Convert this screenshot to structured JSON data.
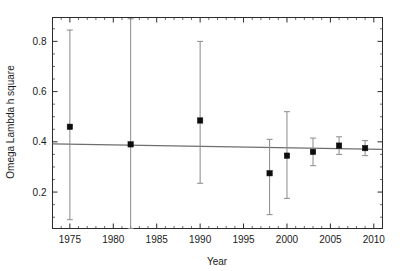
{
  "chart_data": {
    "type": "scatter",
    "title": "",
    "xlabel": "Year",
    "ylabel": "Omega Lambda h square",
    "xlim": [
      1973,
      2011
    ],
    "ylim": [
      0.055,
      0.895
    ],
    "grid": false,
    "legend": null,
    "x_ticks": [
      1975,
      1980,
      1985,
      1990,
      1995,
      2000,
      2005,
      2010
    ],
    "x_tick_labels": [
      "1975",
      "1980",
      "1985",
      "1990",
      "1995",
      "2000",
      "2005",
      "2010"
    ],
    "y_ticks": [
      0.2,
      0.4,
      0.6,
      0.8
    ],
    "y_tick_labels": [
      "0.2",
      "0.4",
      "0.6",
      "0.8"
    ],
    "x": [
      1975,
      1982,
      1990,
      1998,
      2000,
      2003,
      2006,
      2009
    ],
    "y": [
      0.46,
      0.39,
      0.485,
      0.275,
      0.345,
      0.36,
      0.385,
      0.375
    ],
    "yerr_upper": [
      0.385,
      0.5,
      0.315,
      0.135,
      0.175,
      0.055,
      0.035,
      0.03
    ],
    "yerr_lower": [
      0.37,
      0.5,
      0.25,
      0.165,
      0.17,
      0.055,
      0.035,
      0.03
    ],
    "series": [
      {
        "name": "Omega Lambda h square measurements",
        "marker": "square",
        "marker_color": "#0d0d0d",
        "errorbar_color": "#8a8a8a",
        "points": [
          {
            "x": 1975,
            "y": 0.46,
            "err_up": 0.385,
            "err_dn": 0.37
          },
          {
            "x": 1982,
            "y": 0.39,
            "err_up": 0.5,
            "err_dn": 0.5
          },
          {
            "x": 1990,
            "y": 0.485,
            "err_up": 0.315,
            "err_dn": 0.25
          },
          {
            "x": 1998,
            "y": 0.275,
            "err_up": 0.135,
            "err_dn": 0.165
          },
          {
            "x": 2000,
            "y": 0.345,
            "err_up": 0.175,
            "err_dn": 0.17
          },
          {
            "x": 2003,
            "y": 0.36,
            "err_up": 0.055,
            "err_dn": 0.055
          },
          {
            "x": 2006,
            "y": 0.385,
            "err_up": 0.035,
            "err_dn": 0.035
          },
          {
            "x": 2009,
            "y": 0.375,
            "err_up": 0.03,
            "err_dn": 0.03
          }
        ]
      }
    ],
    "fit_line": {
      "name": "trend-line",
      "color": "#6e6e6e",
      "x_start": 1973,
      "y_start": 0.392,
      "x_end": 2011,
      "y_end": 0.37
    }
  },
  "axes": {
    "x_label": "Year",
    "y_label": "Omega Lambda h square",
    "x_tick_labels": [
      "1975",
      "1980",
      "1985",
      "1990",
      "1995",
      "2000",
      "2005",
      "2010"
    ],
    "y_tick_labels": [
      "0.2",
      "0.4",
      "0.6",
      "0.8"
    ]
  },
  "colors": {
    "marker": "#0d0d0d",
    "errorbar": "#8a8a8a",
    "fitline": "#6e6e6e",
    "frame": "#2b2b2b",
    "background": "#ffffff"
  }
}
